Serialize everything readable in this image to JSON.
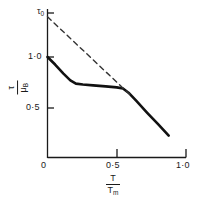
{
  "chart_data": {
    "type": "line",
    "title": "",
    "xlabel_numerator": "T",
    "xlabel_denominator": "T",
    "xlabel_denominator_sub": "m",
    "ylabel_numerator": "τ",
    "ylabel_denominator": "μ",
    "ylabel_denominator_sub": "B",
    "xlim": [
      0,
      1.0
    ],
    "ylim": [
      0,
      1.45
    ],
    "grid": false,
    "legend": "none",
    "x_ticks": [
      {
        "value": 0,
        "label": "0"
      },
      {
        "value": 0.5,
        "label": "0·5"
      },
      {
        "value": 1.0,
        "label": "1·0"
      }
    ],
    "y_ticks": [
      {
        "value": 0.5,
        "label": "0·5"
      },
      {
        "value": 1.0,
        "label": "1·0"
      },
      {
        "value": 1.4,
        "label": "τ",
        "label_sub": "0"
      }
    ],
    "annotations": [
      {
        "name": "tau-zero-intercept",
        "text": "τ",
        "sub": "0",
        "x": 0,
        "y": 1.4
      }
    ],
    "series": [
      {
        "name": "athermal-plateau-curve",
        "style": "solid",
        "color": "#111111",
        "width": 2.6,
        "points": [
          [
            0.0,
            1.0
          ],
          [
            0.055,
            0.925
          ],
          [
            0.115,
            0.835
          ],
          [
            0.165,
            0.768
          ],
          [
            0.205,
            0.735
          ],
          [
            0.255,
            0.726
          ],
          [
            0.33,
            0.718
          ],
          [
            0.42,
            0.708
          ],
          [
            0.5,
            0.698
          ],
          [
            0.545,
            0.686
          ],
          [
            0.585,
            0.645
          ],
          [
            0.64,
            0.565
          ],
          [
            0.72,
            0.445
          ],
          [
            0.8,
            0.33
          ],
          [
            0.875,
            0.218
          ]
        ]
      },
      {
        "name": "thermal-reference-line",
        "style": "dashed",
        "color": "#333333",
        "width": 1.4,
        "points": [
          [
            0.0,
            1.4
          ],
          [
            0.6,
            0.62
          ]
        ]
      }
    ]
  },
  "axes": {
    "x_axis_name": "homologous-temperature-axis",
    "y_axis_name": "normalized-stress-axis"
  }
}
